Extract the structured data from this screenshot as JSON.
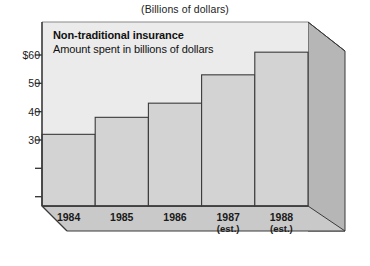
{
  "figure": {
    "top_caption": "(Billions of dollars)",
    "plot_caption_title": "Non-traditional insurance",
    "plot_caption_subtitle": "Amount spent in billions of dollars"
  },
  "colors": {
    "page_background": "#ffffff",
    "plot_background": "#ebebeb",
    "bar_fill": "#d3d3d3",
    "side_panel_fill": "#b6b6b6",
    "base_panel_fill": "#c9c9c9",
    "axis_line": "#3a3a3a",
    "bar_outline": "#3a3a3a",
    "text": "#1a1a1a"
  },
  "chart_data": {
    "type": "bar",
    "title": "(Billions of dollars)",
    "subtitle": "Non-traditional insurance — Amount spent in billions of dollars",
    "xlabel": "",
    "ylabel": "",
    "categories": [
      "1984",
      "1985",
      "1986",
      "1987",
      "1988"
    ],
    "category_notes": [
      "",
      "",
      "",
      "(est.)",
      "(est.)"
    ],
    "values": [
      32,
      38,
      43,
      53,
      61
    ],
    "ylim": [
      0,
      65
    ],
    "yticks": [
      10,
      20,
      30,
      40,
      50,
      60
    ],
    "ytick_labels": [
      "",
      "",
      "30",
      "40",
      "50",
      "$60"
    ],
    "grid": false,
    "legend": "none",
    "style_3d": true
  }
}
